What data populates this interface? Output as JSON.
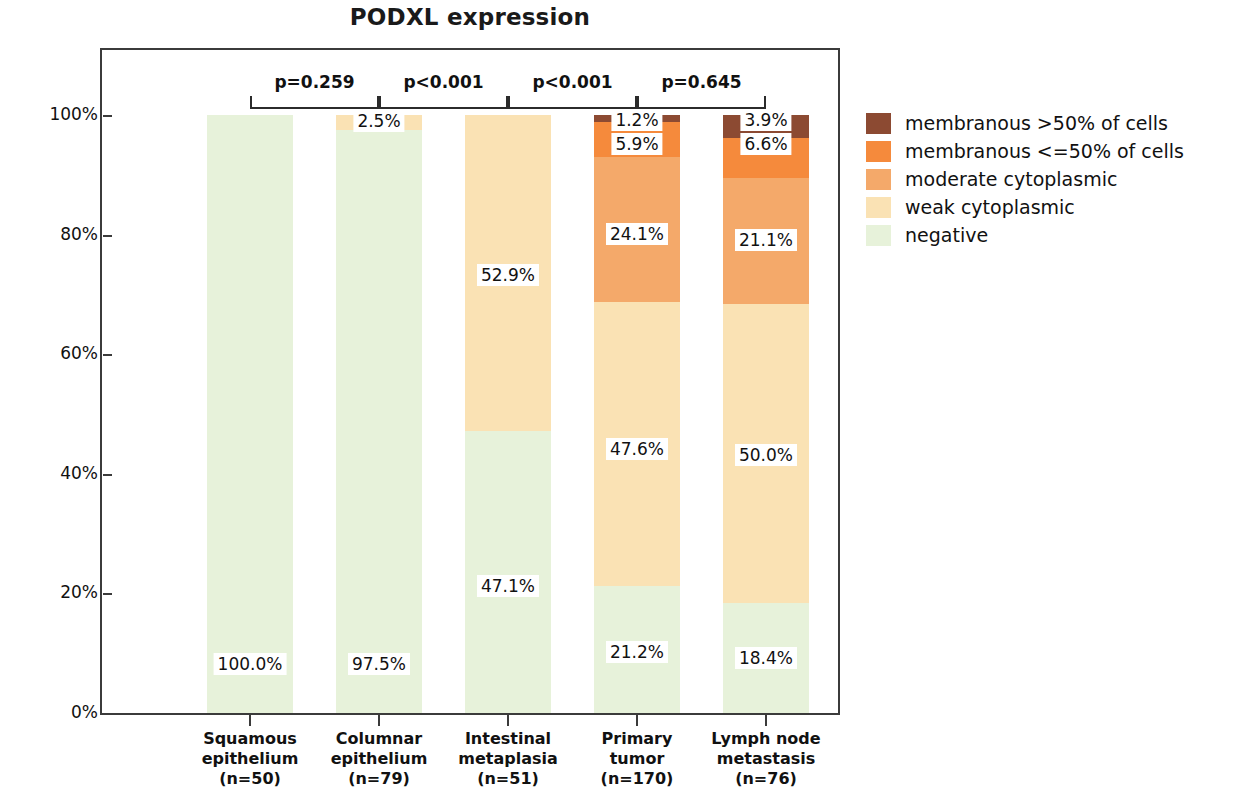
{
  "chart_data": {
    "type": "bar",
    "subtype": "stacked-bar-100-percent",
    "title": "PODXL expression",
    "xlabel": "",
    "ylabel": "Percent",
    "ylim": [
      0,
      100
    ],
    "yticks": [
      "0%",
      "20%",
      "40%",
      "60%",
      "80%",
      "100%"
    ],
    "ytick_values": [
      0,
      20,
      40,
      60,
      80,
      100
    ],
    "grid": false,
    "legend_position": "right",
    "categories": [
      "Squamous epithelium",
      "Columnar epithelium",
      "Intestinal metaplasia",
      "Primary tumor",
      "Lymph node metastasis"
    ],
    "category_lines": [
      [
        "Squamous",
        "epithelium",
        "(n=50)"
      ],
      [
        "Columnar",
        "epithelium",
        "(n=79)"
      ],
      [
        "Intestinal",
        "metaplasia",
        "(n=51)"
      ],
      [
        "Primary",
        "tumor",
        "(n=170)"
      ],
      [
        "Lymph node",
        "metastasis",
        "(n=76)"
      ]
    ],
    "sample_sizes": [
      50,
      79,
      51,
      170,
      76
    ],
    "series": [
      {
        "name": "negative",
        "color": "#e7f2da",
        "values": [
          100.0,
          97.5,
          47.1,
          21.2,
          18.4
        ],
        "labels": [
          "100.0%",
          "97.5%",
          "47.1%",
          "21.2%",
          "18.4%"
        ]
      },
      {
        "name": "weak cytoplasmic",
        "color": "#fae2b4",
        "values": [
          0.0,
          2.5,
          52.9,
          47.6,
          50.0
        ],
        "labels": [
          "",
          "2.5%",
          "52.9%",
          "47.6%",
          "50.0%"
        ]
      },
      {
        "name": "moderate cytoplasmic",
        "color": "#f4a96a",
        "values": [
          0.0,
          0.0,
          0.0,
          24.1,
          21.1
        ],
        "labels": [
          "",
          "",
          "",
          "24.1%",
          "21.1%"
        ]
      },
      {
        "name": "membranous <=50% of cells",
        "color": "#f58a3c",
        "values": [
          0.0,
          0.0,
          0.0,
          5.9,
          6.6
        ],
        "labels": [
          "",
          "",
          "",
          "5.9%",
          "6.6%"
        ]
      },
      {
        "name": "membranous >50% of cells",
        "color": "#8c4a32",
        "values": [
          0.0,
          0.0,
          0.0,
          1.2,
          3.9
        ],
        "labels": [
          "",
          "",
          "",
          "1.2%",
          "3.9%"
        ]
      }
    ],
    "annotations": [
      {
        "text": "p=0.259",
        "between": [
          "Squamous epithelium",
          "Columnar epithelium"
        ]
      },
      {
        "text": "p<0.001",
        "between": [
          "Columnar epithelium",
          "Intestinal metaplasia"
        ]
      },
      {
        "text": "p<0.001",
        "between": [
          "Intestinal metaplasia",
          "Primary tumor"
        ]
      },
      {
        "text": "p=0.645",
        "between": [
          "Primary tumor",
          "Lymph node metastasis"
        ]
      }
    ]
  },
  "legend": {
    "items": [
      {
        "label": "membranous >50% of cells",
        "color": "#8c4a32"
      },
      {
        "label": "membranous <=50% of cells",
        "color": "#f58a3c"
      },
      {
        "label": "moderate cytoplasmic",
        "color": "#f4a96a"
      },
      {
        "label": "weak cytoplasmic",
        "color": "#fae2b4"
      },
      {
        "label": "negative",
        "color": "#e7f2da"
      }
    ]
  }
}
